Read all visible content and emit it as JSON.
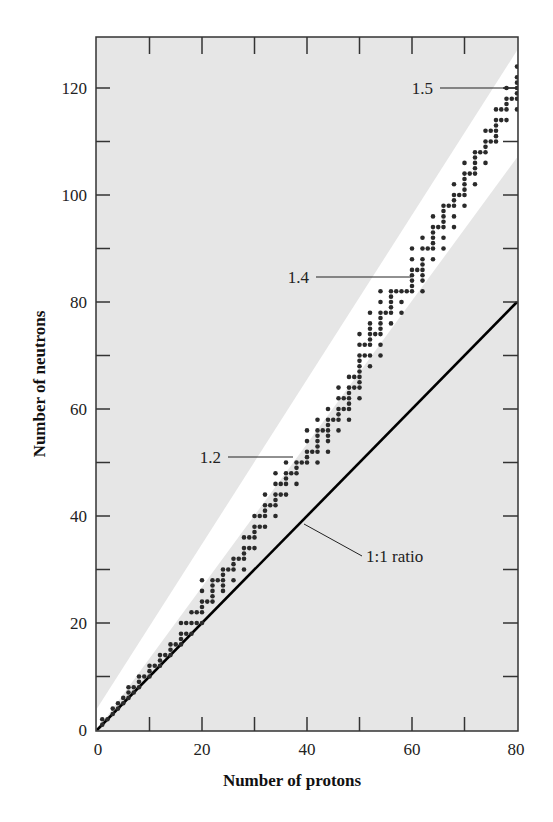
{
  "chart_data": {
    "type": "scatter",
    "title": "",
    "xlabel": "Number of protons",
    "ylabel": "Number of neutrons",
    "xlim": [
      0,
      80
    ],
    "ylim": [
      0,
      129
    ],
    "x_ticks": [
      0,
      20,
      40,
      60,
      80
    ],
    "y_ticks": [
      0,
      20,
      40,
      60,
      80,
      100,
      120
    ],
    "minor_x_ticks": [
      10,
      30,
      50,
      70
    ],
    "minor_y_ticks": [
      10,
      30,
      50,
      70,
      90,
      110
    ],
    "grid": false,
    "legend": null,
    "background_color": "#e6e6e6",
    "band_color": "#ffffff",
    "point_color": "#2a2a2a",
    "band_of_stability": {
      "upper": [
        [
          0,
          4
        ],
        [
          80,
          127
        ]
      ],
      "lower": [
        [
          0,
          0
        ],
        [
          80,
          107
        ]
      ]
    },
    "lines": [
      {
        "name": "1:1 ratio",
        "points": [
          [
            0,
            0
          ],
          [
            80,
            80
          ]
        ],
        "color": "#000000"
      }
    ],
    "annotations": [
      {
        "text": "1.2",
        "x": 37,
        "y": 51,
        "label_at": [
          24,
          51
        ]
      },
      {
        "text": "1.4",
        "x": 59,
        "y": 83,
        "label_at": [
          45,
          83
        ]
      },
      {
        "text": "1.5",
        "x": 80,
        "y": 120,
        "label_at": [
          70,
          120
        ]
      },
      {
        "text": "1:1 ratio",
        "x": 39,
        "y": 40,
        "label_at": [
          52,
          34
        ]
      }
    ],
    "series": [
      {
        "name": "Stable nuclei",
        "points": [
          [
            1,
            1
          ],
          [
            1,
            2
          ],
          [
            2,
            2
          ],
          [
            3,
            3
          ],
          [
            3,
            4
          ],
          [
            4,
            4
          ],
          [
            4,
            5
          ],
          [
            5,
            5
          ],
          [
            5,
            6
          ],
          [
            6,
            6
          ],
          [
            6,
            7
          ],
          [
            6,
            8
          ],
          [
            7,
            7
          ],
          [
            7,
            8
          ],
          [
            8,
            8
          ],
          [
            8,
            9
          ],
          [
            8,
            10
          ],
          [
            9,
            10
          ],
          [
            10,
            10
          ],
          [
            10,
            11
          ],
          [
            10,
            12
          ],
          [
            11,
            12
          ],
          [
            12,
            12
          ],
          [
            12,
            13
          ],
          [
            12,
            14
          ],
          [
            13,
            14
          ],
          [
            14,
            14
          ],
          [
            14,
            15
          ],
          [
            14,
            16
          ],
          [
            15,
            16
          ],
          [
            16,
            16
          ],
          [
            16,
            17
          ],
          [
            16,
            18
          ],
          [
            16,
            20
          ],
          [
            17,
            18
          ],
          [
            17,
            20
          ],
          [
            18,
            18
          ],
          [
            18,
            20
          ],
          [
            18,
            22
          ],
          [
            19,
            20
          ],
          [
            19,
            22
          ],
          [
            20,
            20
          ],
          [
            20,
            22
          ],
          [
            20,
            23
          ],
          [
            20,
            24
          ],
          [
            20,
            26
          ],
          [
            20,
            28
          ],
          [
            21,
            24
          ],
          [
            22,
            24
          ],
          [
            22,
            25
          ],
          [
            22,
            26
          ],
          [
            22,
            27
          ],
          [
            22,
            28
          ],
          [
            23,
            28
          ],
          [
            24,
            26
          ],
          [
            24,
            27
          ],
          [
            24,
            28
          ],
          [
            24,
            29
          ],
          [
            24,
            30
          ],
          [
            25,
            30
          ],
          [
            26,
            28
          ],
          [
            26,
            30
          ],
          [
            26,
            31
          ],
          [
            26,
            32
          ],
          [
            27,
            32
          ],
          [
            28,
            30
          ],
          [
            28,
            32
          ],
          [
            28,
            33
          ],
          [
            28,
            34
          ],
          [
            28,
            36
          ],
          [
            29,
            34
          ],
          [
            29,
            36
          ],
          [
            30,
            34
          ],
          [
            30,
            36
          ],
          [
            30,
            37
          ],
          [
            30,
            38
          ],
          [
            30,
            40
          ],
          [
            31,
            38
          ],
          [
            31,
            40
          ],
          [
            32,
            38
          ],
          [
            32,
            40
          ],
          [
            32,
            41
          ],
          [
            32,
            42
          ],
          [
            32,
            44
          ],
          [
            33,
            42
          ],
          [
            34,
            40
          ],
          [
            34,
            42
          ],
          [
            34,
            43
          ],
          [
            34,
            44
          ],
          [
            34,
            46
          ],
          [
            34,
            48
          ],
          [
            35,
            44
          ],
          [
            35,
            46
          ],
          [
            36,
            44
          ],
          [
            36,
            46
          ],
          [
            36,
            47
          ],
          [
            36,
            48
          ],
          [
            36,
            50
          ],
          [
            37,
            48
          ],
          [
            38,
            46
          ],
          [
            38,
            48
          ],
          [
            38,
            49
          ],
          [
            38,
            50
          ],
          [
            39,
            50
          ],
          [
            40,
            50
          ],
          [
            40,
            51
          ],
          [
            40,
            52
          ],
          [
            40,
            54
          ],
          [
            40,
            56
          ],
          [
            41,
            52
          ],
          [
            42,
            50
          ],
          [
            42,
            52
          ],
          [
            42,
            53
          ],
          [
            42,
            54
          ],
          [
            42,
            55
          ],
          [
            42,
            56
          ],
          [
            42,
            58
          ],
          [
            43,
            56
          ],
          [
            44,
            52
          ],
          [
            44,
            54
          ],
          [
            44,
            55
          ],
          [
            44,
            56
          ],
          [
            44,
            57
          ],
          [
            44,
            58
          ],
          [
            44,
            60
          ],
          [
            45,
            58
          ],
          [
            46,
            56
          ],
          [
            46,
            58
          ],
          [
            46,
            59
          ],
          [
            46,
            60
          ],
          [
            46,
            62
          ],
          [
            46,
            64
          ],
          [
            47,
            60
          ],
          [
            47,
            62
          ],
          [
            48,
            58
          ],
          [
            48,
            60
          ],
          [
            48,
            61
          ],
          [
            48,
            62
          ],
          [
            48,
            63
          ],
          [
            48,
            64
          ],
          [
            48,
            66
          ],
          [
            49,
            64
          ],
          [
            49,
            66
          ],
          [
            50,
            62
          ],
          [
            50,
            64
          ],
          [
            50,
            65
          ],
          [
            50,
            66
          ],
          [
            50,
            67
          ],
          [
            50,
            68
          ],
          [
            50,
            69
          ],
          [
            50,
            70
          ],
          [
            50,
            72
          ],
          [
            50,
            74
          ],
          [
            51,
            70
          ],
          [
            51,
            72
          ],
          [
            52,
            68
          ],
          [
            52,
            70
          ],
          [
            52,
            72
          ],
          [
            52,
            73
          ],
          [
            52,
            74
          ],
          [
            52,
            75
          ],
          [
            52,
            76
          ],
          [
            52,
            78
          ],
          [
            53,
            74
          ],
          [
            54,
            70
          ],
          [
            54,
            72
          ],
          [
            54,
            74
          ],
          [
            54,
            75
          ],
          [
            54,
            76
          ],
          [
            54,
            77
          ],
          [
            54,
            78
          ],
          [
            54,
            80
          ],
          [
            54,
            82
          ],
          [
            55,
            78
          ],
          [
            56,
            76
          ],
          [
            56,
            78
          ],
          [
            56,
            79
          ],
          [
            56,
            80
          ],
          [
            56,
            81
          ],
          [
            56,
            82
          ],
          [
            57,
            82
          ],
          [
            58,
            78
          ],
          [
            58,
            80
          ],
          [
            58,
            82
          ],
          [
            59,
            82
          ],
          [
            60,
            82
          ],
          [
            60,
            83
          ],
          [
            60,
            84
          ],
          [
            60,
            85
          ],
          [
            60,
            86
          ],
          [
            60,
            88
          ],
          [
            60,
            90
          ],
          [
            61,
            86
          ],
          [
            62,
            82
          ],
          [
            62,
            84
          ],
          [
            62,
            85
          ],
          [
            62,
            86
          ],
          [
            62,
            87
          ],
          [
            62,
            88
          ],
          [
            62,
            90
          ],
          [
            62,
            92
          ],
          [
            63,
            90
          ],
          [
            64,
            88
          ],
          [
            64,
            90
          ],
          [
            64,
            91
          ],
          [
            64,
            92
          ],
          [
            64,
            93
          ],
          [
            64,
            94
          ],
          [
            64,
            96
          ],
          [
            65,
            94
          ],
          [
            66,
            90
          ],
          [
            66,
            92
          ],
          [
            66,
            94
          ],
          [
            66,
            95
          ],
          [
            66,
            96
          ],
          [
            66,
            97
          ],
          [
            66,
            98
          ],
          [
            67,
            98
          ],
          [
            68,
            94
          ],
          [
            68,
            96
          ],
          [
            68,
            98
          ],
          [
            68,
            99
          ],
          [
            68,
            100
          ],
          [
            68,
            102
          ],
          [
            69,
            100
          ],
          [
            70,
            98
          ],
          [
            70,
            100
          ],
          [
            70,
            101
          ],
          [
            70,
            102
          ],
          [
            70,
            103
          ],
          [
            70,
            104
          ],
          [
            70,
            106
          ],
          [
            71,
            104
          ],
          [
            72,
            102
          ],
          [
            72,
            104
          ],
          [
            72,
            105
          ],
          [
            72,
            106
          ],
          [
            72,
            107
          ],
          [
            72,
            108
          ],
          [
            73,
            108
          ],
          [
            74,
            106
          ],
          [
            74,
            108
          ],
          [
            74,
            109
          ],
          [
            74,
            110
          ],
          [
            74,
            112
          ],
          [
            75,
            110
          ],
          [
            75,
            112
          ],
          [
            76,
            110
          ],
          [
            76,
            111
          ],
          [
            76,
            112
          ],
          [
            76,
            113
          ],
          [
            76,
            114
          ],
          [
            76,
            116
          ],
          [
            77,
            114
          ],
          [
            77,
            116
          ],
          [
            78,
            114
          ],
          [
            78,
            116
          ],
          [
            78,
            117
          ],
          [
            78,
            118
          ],
          [
            78,
            120
          ],
          [
            79,
            118
          ],
          [
            80,
            116
          ],
          [
            80,
            118
          ],
          [
            80,
            119
          ],
          [
            80,
            120
          ],
          [
            80,
            121
          ],
          [
            80,
            122
          ],
          [
            80,
            124
          ]
        ]
      }
    ]
  },
  "labels": {
    "xlabel": "Number of protons",
    "ylabel": "Number of neutrons",
    "x_ticks": [
      "0",
      "20",
      "40",
      "60",
      "80"
    ],
    "y_ticks": [
      "0",
      "20",
      "40",
      "60",
      "80",
      "100",
      "120"
    ],
    "ann_12": "1.2",
    "ann_14": "1.4",
    "ann_15": "1.5",
    "ann_11": "1:1 ratio"
  }
}
